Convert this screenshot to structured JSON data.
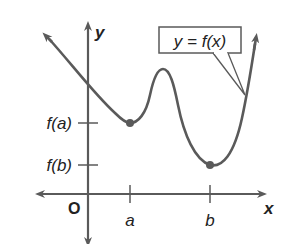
{
  "diagram": {
    "type": "function-graph",
    "axes": {
      "x_label": "x",
      "y_label": "y",
      "origin_label": "O"
    },
    "x_ticks": [
      {
        "label": "a"
      },
      {
        "label": "b"
      }
    ],
    "y_ticks": [
      {
        "label": "f(a)"
      },
      {
        "label": "f(b)"
      }
    ],
    "callout": {
      "label": "y = f(x)"
    },
    "points": [
      {
        "name": "local-min-a",
        "desc": "(a, f(a))"
      },
      {
        "name": "local-min-b",
        "desc": "(b, f(b))"
      }
    ],
    "colors": {
      "curve": "#5a5a5a",
      "axes": "#5a5a5a",
      "text": "#222222",
      "background": "#ffffff"
    }
  }
}
